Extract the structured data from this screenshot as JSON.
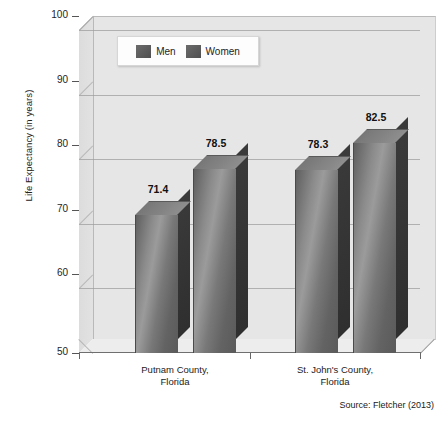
{
  "chart_data": {
    "type": "bar",
    "title": "",
    "subtitle": "",
    "xlabel": "",
    "ylabel": "Life Expectancy (in years)",
    "ylim": [
      50,
      100
    ],
    "yticks": [
      50,
      60,
      70,
      80,
      90,
      100
    ],
    "ytick_labels": [
      "50",
      "60",
      "70",
      "80",
      "90",
      "100"
    ],
    "grid": true,
    "legend_position": "top-left-inside",
    "categories": [
      "Putnam County, Florida",
      "St. John's County, Florida"
    ],
    "category_lines": [
      [
        "Putnam County,",
        "Florida"
      ],
      [
        "St. John's County,",
        "Florida"
      ]
    ],
    "series": [
      {
        "name": "Men",
        "values": [
          71.4,
          78.3
        ],
        "color": "#6b6b6b"
      },
      {
        "name": "Women",
        "values": [
          78.5,
          82.5
        ],
        "color": "#6b6b6b"
      }
    ],
    "data_labels": [
      "71.4",
      "78.5",
      "78.3",
      "82.5"
    ],
    "annotations": [
      "Source: Fletcher (2013)"
    ],
    "style": "3d-grayscale"
  },
  "legend": {
    "items": [
      {
        "label": "Men"
      },
      {
        "label": "Women"
      }
    ]
  },
  "axis": {
    "y_title": "Life Expectancy (in years)",
    "y_labels": [
      "100",
      "90",
      "80",
      "70",
      "60",
      "50"
    ]
  },
  "bars": [
    {
      "label": "71.4",
      "series": "Men",
      "category": "Putnam County, Florida"
    },
    {
      "label": "78.5",
      "series": "Women",
      "category": "Putnam County, Florida"
    },
    {
      "label": "78.3",
      "series": "Men",
      "category": "St. John's County, Florida"
    },
    {
      "label": "82.5",
      "series": "Women",
      "category": "St. John's County, Florida"
    }
  ],
  "categories": [
    {
      "line1": "Putnam County,",
      "line2": "Florida"
    },
    {
      "line1": "St. John's County,",
      "line2": "Florida"
    }
  ],
  "footer": {
    "source": "Source: Fletcher (2013)"
  },
  "colors": {
    "bar_face": "#6b6b6b",
    "bar_side": "#333333",
    "plot_background": "#e6e6e6",
    "gridline": "#9d9d9d",
    "text": "#1a1a1a"
  }
}
